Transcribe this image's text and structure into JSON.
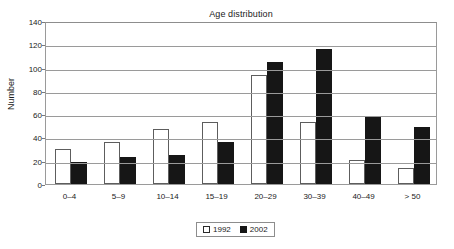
{
  "chart_data": {
    "type": "bar",
    "title": "Age distribution",
    "xlabel": "",
    "ylabel": "Number",
    "categories": [
      "0–4",
      "5–9",
      "10–14",
      "15–19",
      "20–29",
      "30–39",
      "40–49",
      "> 50"
    ],
    "series": [
      {
        "name": "1992",
        "color": "#ffffff",
        "values": [
          30,
          36,
          47,
          53,
          94,
          53,
          21,
          14
        ]
      },
      {
        "name": "2002",
        "color": "#161616",
        "values": [
          19,
          23,
          25,
          36,
          105,
          116,
          58,
          49
        ]
      }
    ],
    "ylim": [
      0,
      140
    ],
    "yticks": [
      0,
      20,
      40,
      60,
      80,
      100,
      120,
      140
    ],
    "ytick_labels": [
      "0",
      "20",
      "40",
      "60",
      "80",
      "100",
      "120",
      "140"
    ],
    "grid": true,
    "legend_position": "bottom-center"
  },
  "legend": {
    "items": [
      {
        "label": "1992",
        "swatch": "white-square"
      },
      {
        "label": "2002",
        "swatch": "black-square"
      }
    ]
  }
}
